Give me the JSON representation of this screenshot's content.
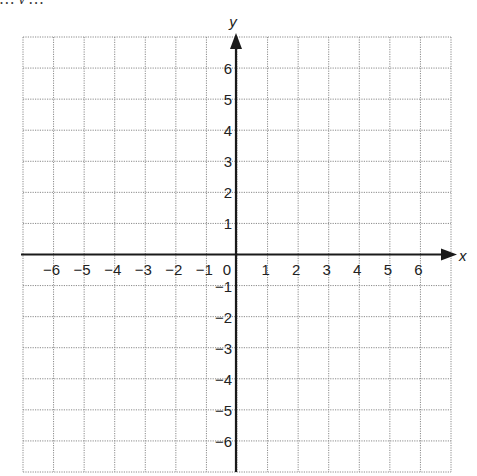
{
  "header": {
    "clipped_text": "… y …"
  },
  "grid": {
    "left": 23,
    "top": 37,
    "right": 451,
    "bottom": 472,
    "cols": 14,
    "rows": 14,
    "line_color": "#8a8a8a",
    "axis_color": "#1a1a1a"
  },
  "axes": {
    "x_label": "x",
    "y_label": "y",
    "x_ticks": [
      -6,
      -5,
      -4,
      -3,
      -2,
      -1,
      0,
      1,
      2,
      3,
      4,
      5,
      6
    ],
    "y_ticks": [
      6,
      5,
      4,
      3,
      2,
      1,
      -1,
      -2,
      -3,
      -4,
      -5,
      -6
    ],
    "origin_label": "0",
    "x_range": [
      -7,
      7
    ],
    "y_range": [
      -7,
      7
    ]
  },
  "chart_data": {
    "type": "coordinate-grid",
    "title": "",
    "xlabel": "x",
    "ylabel": "y",
    "xlim": [
      -7,
      7
    ],
    "ylim": [
      -7,
      7
    ],
    "x_tick_labels": [
      "−6",
      "−5",
      "−4",
      "−3",
      "−2",
      "−1",
      "0",
      "1",
      "2",
      "3",
      "4",
      "5",
      "6"
    ],
    "y_tick_labels": [
      "6",
      "5",
      "4",
      "3",
      "2",
      "1",
      "−1",
      "−2",
      "−3",
      "−4",
      "−5",
      "−6"
    ],
    "grid": true,
    "grid_style": "dotted",
    "points": []
  }
}
